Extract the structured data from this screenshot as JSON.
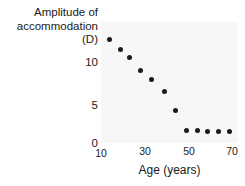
{
  "chart_data": {
    "type": "scatter",
    "title": "",
    "ylabel_lines": [
      "Amplitude of",
      "accommodation",
      "(D)"
    ],
    "ylabel": "Amplitude of accommodation (D)",
    "xlabel": "Age (years)",
    "x": [
      14,
      19,
      23,
      28,
      33,
      39,
      44,
      49,
      54,
      59,
      64,
      69
    ],
    "values": [
      12.8,
      11.6,
      10.6,
      9.0,
      7.8,
      6.3,
      4.0,
      1.6,
      1.5,
      1.4,
      1.4,
      1.4
    ],
    "points": [
      {
        "x": 14,
        "y": 12.8
      },
      {
        "x": 19,
        "y": 11.6
      },
      {
        "x": 23,
        "y": 10.6
      },
      {
        "x": 28,
        "y": 9.0
      },
      {
        "x": 33,
        "y": 7.8
      },
      {
        "x": 39,
        "y": 6.3
      },
      {
        "x": 44,
        "y": 4.0
      },
      {
        "x": 49,
        "y": 1.6
      },
      {
        "x": 54,
        "y": 1.5
      },
      {
        "x": 59,
        "y": 1.4
      },
      {
        "x": 64,
        "y": 1.4
      },
      {
        "x": 69,
        "y": 1.4
      }
    ],
    "xticks": [
      10,
      30,
      50,
      70
    ],
    "xtick_labels": [
      "10",
      "30",
      "50",
      "70"
    ],
    "yticks": [
      0,
      5,
      10
    ],
    "ytick_labels": [
      "0",
      "5",
      "10"
    ],
    "xlim": [
      8,
      72
    ],
    "ylim": [
      0,
      14.5
    ],
    "grid": false,
    "legend": null,
    "marker_color": "#1a1a1a",
    "plot_background": "#f7f7f7",
    "text_color": "#1a1a1a"
  }
}
